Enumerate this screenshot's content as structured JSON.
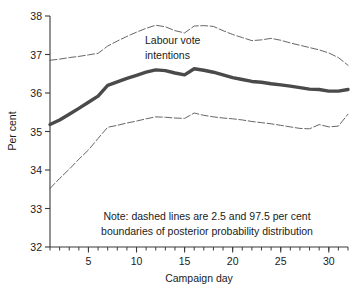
{
  "chart_data": {
    "type": "line",
    "title": "",
    "xlabel": "Campaign day",
    "ylabel": "Per cent",
    "xlim": [
      1,
      32
    ],
    "ylim": [
      32,
      38
    ],
    "grid": false,
    "legend_position": "none",
    "x_ticks_major": [
      5,
      10,
      15,
      20,
      25,
      30
    ],
    "x_ticks_minor_step": 1,
    "y_ticks": [
      32,
      33,
      34,
      35,
      36,
      37,
      38
    ],
    "x": [
      1,
      2,
      3,
      4,
      5,
      6,
      7,
      8,
      9,
      10,
      11,
      12,
      13,
      14,
      15,
      16,
      17,
      18,
      19,
      20,
      21,
      22,
      23,
      24,
      25,
      26,
      27,
      28,
      29,
      30,
      31,
      32
    ],
    "series": [
      {
        "name": "Upper 97.5 per cent boundary",
        "style": "dashed",
        "color": "#555555",
        "width": 0.9,
        "values": [
          36.85,
          36.88,
          36.92,
          36.95,
          36.99,
          37.03,
          37.22,
          37.35,
          37.47,
          37.58,
          37.68,
          37.76,
          37.72,
          37.62,
          37.56,
          37.74,
          37.75,
          37.73,
          37.62,
          37.52,
          37.44,
          37.36,
          37.38,
          37.42,
          37.37,
          37.3,
          37.24,
          37.18,
          37.12,
          37.04,
          36.92,
          36.72
        ]
      },
      {
        "name": "Labour vote intentions (posterior mean)",
        "style": "solid",
        "color": "#4a4a4a",
        "width": 3.4,
        "values": [
          35.18,
          35.3,
          35.45,
          35.6,
          35.76,
          35.92,
          36.2,
          36.29,
          36.38,
          36.46,
          36.54,
          36.6,
          36.58,
          36.52,
          36.47,
          36.63,
          36.59,
          36.54,
          36.47,
          36.4,
          36.35,
          36.3,
          36.28,
          36.24,
          36.21,
          36.18,
          36.14,
          36.1,
          36.09,
          36.05,
          36.05,
          36.09
        ]
      },
      {
        "name": "Lower 2.5 per cent boundary",
        "style": "dashed",
        "color": "#555555",
        "width": 0.9,
        "values": [
          33.52,
          33.78,
          34.02,
          34.28,
          34.52,
          34.82,
          35.11,
          35.16,
          35.22,
          35.27,
          35.33,
          35.38,
          35.37,
          35.35,
          35.34,
          35.48,
          35.42,
          35.38,
          35.35,
          35.33,
          35.3,
          35.26,
          35.23,
          35.2,
          35.16,
          35.12,
          35.08,
          35.07,
          35.18,
          35.12,
          35.14,
          35.45
        ]
      }
    ],
    "annotations": [
      {
        "name": "series-label",
        "lines": [
          "Labour vote",
          "intentions"
        ],
        "x": 11.7,
        "y": 37.32
      },
      {
        "name": "note",
        "lines": [
          "Note: dashed lines are 2.5 and 97.5 per cent",
          "boundaries of posterior probability distribution"
        ],
        "x": 16.5,
        "y": 32.9
      }
    ]
  },
  "axes": {
    "y_label": "Per cent",
    "x_label": "Campaign day",
    "y_tick_labels": [
      "32",
      "33",
      "34",
      "35",
      "36",
      "37",
      "38"
    ],
    "x_tick_labels": [
      "5",
      "10",
      "15",
      "20",
      "25",
      "30"
    ]
  },
  "annotation_series_label": {
    "line1": "Labour vote",
    "line2": "intentions"
  },
  "annotation_note": {
    "line1": "Note: dashed lines are 2.5 and 97.5 per cent",
    "line2": "boundaries of posterior probability distribution"
  }
}
